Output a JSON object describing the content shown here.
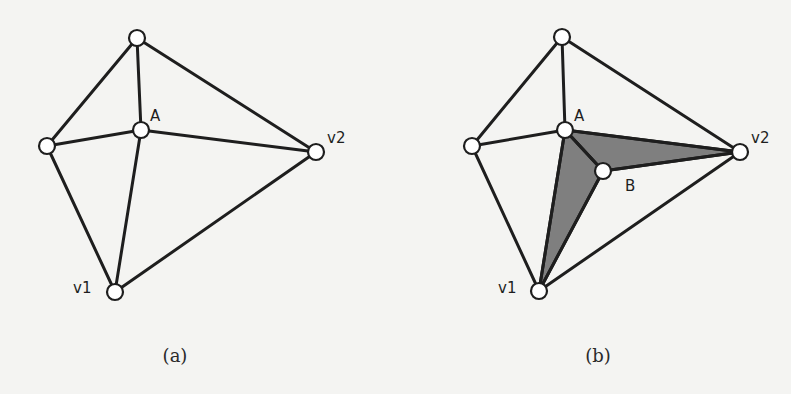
{
  "colors": {
    "background": "#f4f4f2",
    "stroke": "#1e1e1e",
    "node_fill": "#ffffff",
    "shade": "#7f7f7f"
  },
  "subfigures": [
    {
      "id": "a",
      "caption": "(a)",
      "caption_pos": [
        175,
        362
      ],
      "nodes": {
        "top": {
          "x": 137,
          "y": 38,
          "label": ""
        },
        "left": {
          "x": 47,
          "y": 146,
          "label": ""
        },
        "A": {
          "x": 141,
          "y": 130,
          "label": "A",
          "lx": 150,
          "ly": 121
        },
        "v2": {
          "x": 316,
          "y": 152,
          "label": "v2",
          "lx": 327,
          "ly": 143
        },
        "v1": {
          "x": 115,
          "y": 292,
          "label": "v1",
          "lx": 73,
          "ly": 293
        }
      },
      "edges": [
        [
          "top",
          "left"
        ],
        [
          "top",
          "A"
        ],
        [
          "top",
          "v2"
        ],
        [
          "left",
          "A"
        ],
        [
          "left",
          "v1"
        ],
        [
          "A",
          "v2"
        ],
        [
          "A",
          "v1"
        ],
        [
          "v1",
          "v2"
        ]
      ],
      "faces": []
    },
    {
      "id": "b",
      "caption": "(b)",
      "caption_pos": [
        598,
        362
      ],
      "nodes": {
        "top": {
          "x": 562,
          "y": 37,
          "label": ""
        },
        "left": {
          "x": 472,
          "y": 146,
          "label": ""
        },
        "A": {
          "x": 565,
          "y": 130,
          "label": "A",
          "lx": 574,
          "ly": 121
        },
        "B": {
          "x": 603,
          "y": 171,
          "label": "B",
          "lx": 625,
          "ly": 191
        },
        "v2": {
          "x": 740,
          "y": 152,
          "label": "v2",
          "lx": 751,
          "ly": 143
        },
        "v1": {
          "x": 539,
          "y": 291,
          "label": "v1",
          "lx": 498,
          "ly": 293
        }
      },
      "edges": [
        [
          "top",
          "left"
        ],
        [
          "top",
          "A"
        ],
        [
          "top",
          "v2"
        ],
        [
          "left",
          "A"
        ],
        [
          "left",
          "v1"
        ],
        [
          "A",
          "v2"
        ],
        [
          "A",
          "v1"
        ],
        [
          "v1",
          "v2"
        ],
        [
          "A",
          "B"
        ],
        [
          "B",
          "v2"
        ],
        [
          "B",
          "v1"
        ]
      ],
      "faces": [
        [
          "A",
          "B",
          "v2"
        ],
        [
          "A",
          "v1",
          "B"
        ]
      ]
    }
  ]
}
